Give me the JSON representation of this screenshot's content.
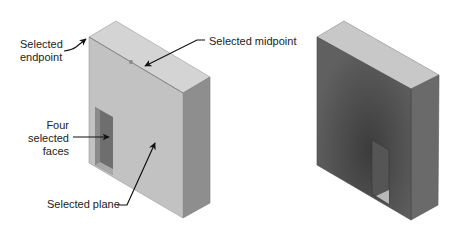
{
  "figure": {
    "left_block": {
      "description": "Light gray block with selections",
      "labels": {
        "endpoint_line1": "Selected",
        "endpoint_line2": "endpoint",
        "midpoint": "Selected midpoint",
        "faces_line1": "Four",
        "faces_line2": "selected",
        "faces_line3": "faces",
        "plane": "Selected plane"
      }
    },
    "right_block": {
      "description": "Dark shaded block result"
    },
    "colors": {
      "left_front": "#c2c2c2",
      "left_top": "#d4d4d4",
      "left_side": "#8e8e8e",
      "left_hole": "#6e6e6e",
      "right_front": "#5a5a5a",
      "right_top": "#c8c8c8",
      "right_side": "#6a6a6a",
      "arrow": "#111111"
    }
  }
}
